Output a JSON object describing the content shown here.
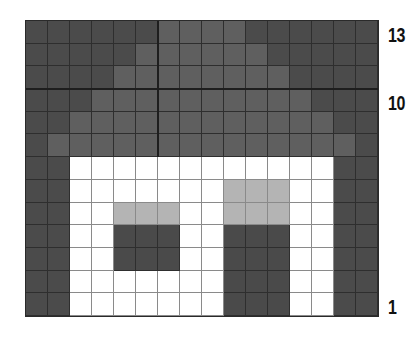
{
  "figure": {
    "columns": 16,
    "rows": 13,
    "legend": {
      "D": {
        "meaning": "dark background cell",
        "color": "#4b4b4b"
      },
      "M": {
        "meaning": "medium gray roof cell",
        "color": "#5f5f5f"
      },
      "W": {
        "meaning": "white cell",
        "color": "#ffffff"
      },
      "L": {
        "meaning": "light gray cell",
        "color": "#b4b4b4"
      },
      "K": {
        "meaning": "dark opening cell",
        "color": "#4a4a4a"
      }
    },
    "grid_rows_top_to_bottom": [
      "DDDDDDMMMMDDDDDD",
      "DDDDDMMMMMMDDDDD",
      "DDDDMMMMMMMMDDDD",
      "DDDMMMMMMMMMMDDD",
      "DDMMMMMMMMMMMMDD",
      "DMMMMMMMMMMMMMMD",
      "DDWWWWWWWWWWWWDD",
      "DDWWWWWWWLLLWWDD",
      "DDWWLLLWWLLLWWDD",
      "DDWWKKKWWKKKWWDD",
      "DDWWKKKWWKKKWWDD",
      "DDWWWWWWWKKKWWDD",
      "DDWWWWWWWKKKWWDD"
    ],
    "row_labels": [
      {
        "text": "13",
        "row_from_top": 0
      },
      {
        "text": "10",
        "row_from_top": 3
      },
      {
        "text": "1",
        "row_from_top": 12
      }
    ]
  }
}
